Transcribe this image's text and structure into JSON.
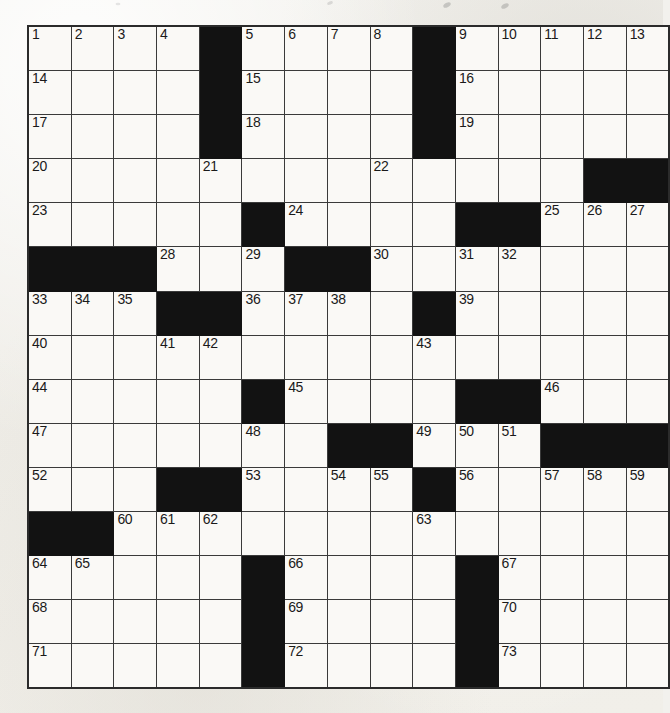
{
  "puzzle": {
    "type": "crossword-grid",
    "title": "",
    "rows": 15,
    "columns": 15,
    "symmetry": "rotational",
    "colors": {
      "paper": "#f2f1ed",
      "cell_fill": "#faf9f6",
      "block_fill": "#121212",
      "grid_line": "#3a3a3a",
      "border": "#2b2b2b",
      "number_text": "#1a1a1a"
    },
    "highest_clue_number": 73,
    "block_count": 39,
    "grid": [
      [
        {
          "n": "1",
          "b": false
        },
        {
          "n": "2",
          "b": false
        },
        {
          "n": "3",
          "b": false
        },
        {
          "n": "4",
          "b": false
        },
        {
          "n": "",
          "b": true
        },
        {
          "n": "5",
          "b": false
        },
        {
          "n": "6",
          "b": false
        },
        {
          "n": "7",
          "b": false
        },
        {
          "n": "8",
          "b": false
        },
        {
          "n": "",
          "b": true
        },
        {
          "n": "9",
          "b": false
        },
        {
          "n": "10",
          "b": false
        },
        {
          "n": "11",
          "b": false
        },
        {
          "n": "12",
          "b": false
        },
        {
          "n": "13",
          "b": false
        }
      ],
      [
        {
          "n": "14",
          "b": false
        },
        {
          "n": "",
          "b": false
        },
        {
          "n": "",
          "b": false
        },
        {
          "n": "",
          "b": false
        },
        {
          "n": "",
          "b": true
        },
        {
          "n": "15",
          "b": false
        },
        {
          "n": "",
          "b": false
        },
        {
          "n": "",
          "b": false
        },
        {
          "n": "",
          "b": false
        },
        {
          "n": "",
          "b": true
        },
        {
          "n": "16",
          "b": false
        },
        {
          "n": "",
          "b": false
        },
        {
          "n": "",
          "b": false
        },
        {
          "n": "",
          "b": false
        },
        {
          "n": "",
          "b": false
        }
      ],
      [
        {
          "n": "17",
          "b": false
        },
        {
          "n": "",
          "b": false
        },
        {
          "n": "",
          "b": false
        },
        {
          "n": "",
          "b": false
        },
        {
          "n": "",
          "b": true
        },
        {
          "n": "18",
          "b": false
        },
        {
          "n": "",
          "b": false
        },
        {
          "n": "",
          "b": false
        },
        {
          "n": "",
          "b": false
        },
        {
          "n": "",
          "b": true
        },
        {
          "n": "19",
          "b": false
        },
        {
          "n": "",
          "b": false
        },
        {
          "n": "",
          "b": false
        },
        {
          "n": "",
          "b": false
        },
        {
          "n": "",
          "b": false
        }
      ],
      [
        {
          "n": "20",
          "b": false
        },
        {
          "n": "",
          "b": false
        },
        {
          "n": "",
          "b": false
        },
        {
          "n": "",
          "b": false
        },
        {
          "n": "21",
          "b": false
        },
        {
          "n": "",
          "b": false
        },
        {
          "n": "",
          "b": false
        },
        {
          "n": "",
          "b": false
        },
        {
          "n": "22",
          "b": false
        },
        {
          "n": "",
          "b": false
        },
        {
          "n": "",
          "b": false
        },
        {
          "n": "",
          "b": false
        },
        {
          "n": "",
          "b": false
        },
        {
          "n": "",
          "b": true
        },
        {
          "n": "",
          "b": true
        }
      ],
      [
        {
          "n": "23",
          "b": false
        },
        {
          "n": "",
          "b": false
        },
        {
          "n": "",
          "b": false
        },
        {
          "n": "",
          "b": false
        },
        {
          "n": "",
          "b": false
        },
        {
          "n": "",
          "b": true
        },
        {
          "n": "24",
          "b": false
        },
        {
          "n": "",
          "b": false
        },
        {
          "n": "",
          "b": false
        },
        {
          "n": "",
          "b": false
        },
        {
          "n": "",
          "b": true
        },
        {
          "n": "",
          "b": true
        },
        {
          "n": "25",
          "b": false
        },
        {
          "n": "26",
          "b": false
        },
        {
          "n": "27",
          "b": false
        }
      ],
      [
        {
          "n": "",
          "b": true
        },
        {
          "n": "",
          "b": true
        },
        {
          "n": "",
          "b": true
        },
        {
          "n": "28",
          "b": false
        },
        {
          "n": "",
          "b": false
        },
        {
          "n": "29",
          "b": false
        },
        {
          "n": "",
          "b": true
        },
        {
          "n": "",
          "b": true
        },
        {
          "n": "30",
          "b": false
        },
        {
          "n": "",
          "b": false
        },
        {
          "n": "31",
          "b": false
        },
        {
          "n": "32",
          "b": false
        },
        {
          "n": "",
          "b": false
        },
        {
          "n": "",
          "b": false
        },
        {
          "n": "",
          "b": false
        }
      ],
      [
        {
          "n": "33",
          "b": false
        },
        {
          "n": "34",
          "b": false
        },
        {
          "n": "35",
          "b": false
        },
        {
          "n": "",
          "b": true
        },
        {
          "n": "",
          "b": true
        },
        {
          "n": "36",
          "b": false
        },
        {
          "n": "37",
          "b": false
        },
        {
          "n": "38",
          "b": false
        },
        {
          "n": "",
          "b": false
        },
        {
          "n": "",
          "b": true
        },
        {
          "n": "39",
          "b": false
        },
        {
          "n": "",
          "b": false
        },
        {
          "n": "",
          "b": false
        },
        {
          "n": "",
          "b": false
        },
        {
          "n": "",
          "b": false
        }
      ],
      [
        {
          "n": "40",
          "b": false
        },
        {
          "n": "",
          "b": false
        },
        {
          "n": "",
          "b": false
        },
        {
          "n": "41",
          "b": false
        },
        {
          "n": "42",
          "b": false
        },
        {
          "n": "",
          "b": false
        },
        {
          "n": "",
          "b": false
        },
        {
          "n": "",
          "b": false
        },
        {
          "n": "",
          "b": false
        },
        {
          "n": "43",
          "b": false
        },
        {
          "n": "",
          "b": false
        },
        {
          "n": "",
          "b": false
        },
        {
          "n": "",
          "b": false
        },
        {
          "n": "",
          "b": false
        },
        {
          "n": "",
          "b": false
        }
      ],
      [
        {
          "n": "44",
          "b": false
        },
        {
          "n": "",
          "b": false
        },
        {
          "n": "",
          "b": false
        },
        {
          "n": "",
          "b": false
        },
        {
          "n": "",
          "b": false
        },
        {
          "n": "",
          "b": true
        },
        {
          "n": "45",
          "b": false
        },
        {
          "n": "",
          "b": false
        },
        {
          "n": "",
          "b": false
        },
        {
          "n": "",
          "b": false
        },
        {
          "n": "",
          "b": true
        },
        {
          "n": "",
          "b": true
        },
        {
          "n": "46",
          "b": false
        },
        {
          "n": "",
          "b": false
        },
        {
          "n": "",
          "b": false
        }
      ],
      [
        {
          "n": "47",
          "b": false
        },
        {
          "n": "",
          "b": false
        },
        {
          "n": "",
          "b": false
        },
        {
          "n": "",
          "b": false
        },
        {
          "n": "",
          "b": false
        },
        {
          "n": "48",
          "b": false
        },
        {
          "n": "",
          "b": false
        },
        {
          "n": "",
          "b": true
        },
        {
          "n": "",
          "b": true
        },
        {
          "n": "49",
          "b": false
        },
        {
          "n": "50",
          "b": false
        },
        {
          "n": "51",
          "b": false
        },
        {
          "n": "",
          "b": true
        },
        {
          "n": "",
          "b": true
        },
        {
          "n": "",
          "b": true
        }
      ],
      [
        {
          "n": "52",
          "b": false
        },
        {
          "n": "",
          "b": false
        },
        {
          "n": "",
          "b": false
        },
        {
          "n": "",
          "b": true
        },
        {
          "n": "",
          "b": true
        },
        {
          "n": "53",
          "b": false
        },
        {
          "n": "",
          "b": false
        },
        {
          "n": "54",
          "b": false
        },
        {
          "n": "55",
          "b": false
        },
        {
          "n": "",
          "b": true
        },
        {
          "n": "56",
          "b": false
        },
        {
          "n": "",
          "b": false
        },
        {
          "n": "57",
          "b": false
        },
        {
          "n": "58",
          "b": false
        },
        {
          "n": "59",
          "b": false
        }
      ],
      [
        {
          "n": "",
          "b": true
        },
        {
          "n": "",
          "b": true
        },
        {
          "n": "60",
          "b": false
        },
        {
          "n": "61",
          "b": false
        },
        {
          "n": "62",
          "b": false
        },
        {
          "n": "",
          "b": false
        },
        {
          "n": "",
          "b": false
        },
        {
          "n": "",
          "b": false
        },
        {
          "n": "",
          "b": false
        },
        {
          "n": "63",
          "b": false
        },
        {
          "n": "",
          "b": false
        },
        {
          "n": "",
          "b": false
        },
        {
          "n": "",
          "b": false
        },
        {
          "n": "",
          "b": false
        },
        {
          "n": "",
          "b": false
        }
      ],
      [
        {
          "n": "64",
          "b": false
        },
        {
          "n": "65",
          "b": false
        },
        {
          "n": "",
          "b": false
        },
        {
          "n": "",
          "b": false
        },
        {
          "n": "",
          "b": false
        },
        {
          "n": "",
          "b": true
        },
        {
          "n": "66",
          "b": false
        },
        {
          "n": "",
          "b": false
        },
        {
          "n": "",
          "b": false
        },
        {
          "n": "",
          "b": false
        },
        {
          "n": "",
          "b": true
        },
        {
          "n": "67",
          "b": false
        },
        {
          "n": "",
          "b": false
        },
        {
          "n": "",
          "b": false
        },
        {
          "n": "",
          "b": false
        }
      ],
      [
        {
          "n": "68",
          "b": false
        },
        {
          "n": "",
          "b": false
        },
        {
          "n": "",
          "b": false
        },
        {
          "n": "",
          "b": false
        },
        {
          "n": "",
          "b": false
        },
        {
          "n": "",
          "b": true
        },
        {
          "n": "69",
          "b": false
        },
        {
          "n": "",
          "b": false
        },
        {
          "n": "",
          "b": false
        },
        {
          "n": "",
          "b": false
        },
        {
          "n": "",
          "b": true
        },
        {
          "n": "70",
          "b": false
        },
        {
          "n": "",
          "b": false
        },
        {
          "n": "",
          "b": false
        },
        {
          "n": "",
          "b": false
        }
      ],
      [
        {
          "n": "71",
          "b": false
        },
        {
          "n": "",
          "b": false
        },
        {
          "n": "",
          "b": false
        },
        {
          "n": "",
          "b": false
        },
        {
          "n": "",
          "b": false
        },
        {
          "n": "",
          "b": true
        },
        {
          "n": "72",
          "b": false
        },
        {
          "n": "",
          "b": false
        },
        {
          "n": "",
          "b": false
        },
        {
          "n": "",
          "b": false
        },
        {
          "n": "",
          "b": true
        },
        {
          "n": "73",
          "b": false
        },
        {
          "n": "",
          "b": false
        },
        {
          "n": "",
          "b": false
        },
        {
          "n": "",
          "b": false
        }
      ]
    ]
  }
}
